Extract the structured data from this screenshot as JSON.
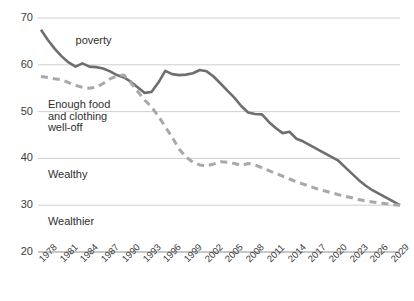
{
  "chart_data": {
    "type": "line",
    "title": "",
    "subtitle": "",
    "xlabel": "",
    "ylabel": "",
    "xlim": [
      1978,
      2030
    ],
    "ylim": [
      20,
      70
    ],
    "grid": true,
    "grid_axis": "y",
    "legend": "none",
    "legend_position": "inline-annotations",
    "yticks": [
      70,
      60,
      50,
      40,
      30,
      20
    ],
    "xticks": [
      1978,
      1981,
      1984,
      1987,
      1990,
      1993,
      1996,
      1999,
      2002,
      2005,
      2008,
      2011,
      2014,
      2017,
      2020,
      2023,
      2026,
      2029
    ],
    "xtick_labels": [
      "1978",
      "1981",
      "1984",
      "1987",
      "1990",
      "1993",
      "1996",
      "1999",
      "2002",
      "2005",
      "2008",
      "2011",
      "2014",
      "2017",
      "2020",
      "2023",
      "2026",
      "2029"
    ],
    "ytick_labels": [
      "70",
      "60",
      "50",
      "40",
      "30",
      "20"
    ],
    "annotations": [
      {
        "text": "poverty",
        "x": 1983.0,
        "y": 65.0
      },
      {
        "text": "Enough food\nand clothing",
        "x": 1979.0,
        "y": 51.5
      },
      {
        "text": "well-off",
        "x": 1979.0,
        "y": 46.5
      },
      {
        "text": "Wealthy",
        "x": 1979.0,
        "y": 36.5
      },
      {
        "text": "Wealthier",
        "x": 1979.0,
        "y": 26.5
      }
    ],
    "series": [
      {
        "name": "solid-series",
        "style": "solid",
        "color": "#6e6e6e",
        "width": 2.6,
        "x": [
          1978,
          1979,
          1980,
          1981,
          1982,
          1983,
          1984,
          1985,
          1986,
          1987,
          1988,
          1989,
          1990,
          1991,
          1992,
          1993,
          1994,
          1995,
          1996,
          1997,
          1998,
          1999,
          2000,
          2001,
          2002,
          2003,
          2004,
          2005,
          2006,
          2007,
          2008,
          2009,
          2010,
          2011,
          2012,
          2013,
          2014,
          2015,
          2016,
          2017,
          2018,
          2019,
          2020,
          2021,
          2022,
          2023,
          2024,
          2025,
          2026,
          2027,
          2028,
          2029,
          2030
        ],
        "values": [
          67.5,
          65.3,
          63.4,
          61.8,
          60.5,
          59.6,
          60.3,
          59.6,
          59.5,
          59.2,
          58.6,
          57.8,
          57.3,
          56.4,
          55.2,
          54.0,
          54.2,
          56.2,
          58.7,
          58.0,
          57.8,
          57.9,
          58.2,
          58.9,
          58.6,
          57.5,
          56.0,
          54.5,
          53.0,
          51.2,
          49.8,
          49.5,
          49.4,
          47.8,
          46.5,
          45.4,
          45.7,
          44.2,
          43.6,
          42.8,
          42.0,
          41.2,
          40.4,
          39.6,
          38.2,
          36.8,
          35.4,
          34.2,
          33.2,
          32.4,
          31.6,
          30.8,
          30.0
        ]
      },
      {
        "name": "dashed-series",
        "style": "dashed",
        "color": "#a8a8a8",
        "width": 3.0,
        "x": [
          1978,
          1979,
          1980,
          1981,
          1982,
          1983,
          1984,
          1985,
          1986,
          1987,
          1988,
          1989,
          1990,
          1991,
          1992,
          1993,
          1994,
          1995,
          1996,
          1997,
          1998,
          1999,
          2000,
          2001,
          2002,
          2003,
          2004,
          2005,
          2006,
          2007,
          2008,
          2009,
          2010,
          2011,
          2012,
          2013,
          2014,
          2015,
          2016,
          2017,
          2018,
          2019,
          2020,
          2021,
          2022,
          2023,
          2024,
          2025,
          2026,
          2027,
          2028,
          2029,
          2030
        ],
        "values": [
          57.5,
          57.3,
          57.0,
          56.8,
          56.2,
          55.6,
          55.2,
          55.0,
          55.2,
          56.0,
          57.0,
          57.6,
          57.8,
          56.2,
          54.3,
          52.5,
          51.0,
          49.0,
          46.8,
          44.5,
          42.0,
          40.3,
          39.2,
          38.6,
          38.4,
          38.8,
          39.3,
          39.2,
          38.9,
          38.5,
          38.9,
          38.6,
          38.0,
          37.4,
          36.8,
          36.2,
          35.6,
          35.0,
          34.5,
          34.0,
          33.5,
          33.1,
          32.7,
          32.3,
          31.9,
          31.6,
          31.2,
          30.9,
          30.7,
          30.5,
          30.3,
          30.1,
          30.0
        ]
      }
    ]
  },
  "layout": {
    "plot_left": 41,
    "plot_right": 400,
    "plot_top": 18,
    "plot_bottom": 252,
    "grid_color": "#c9c9c9",
    "axis_color": "#8f8f8f",
    "background": "#ffffff"
  }
}
